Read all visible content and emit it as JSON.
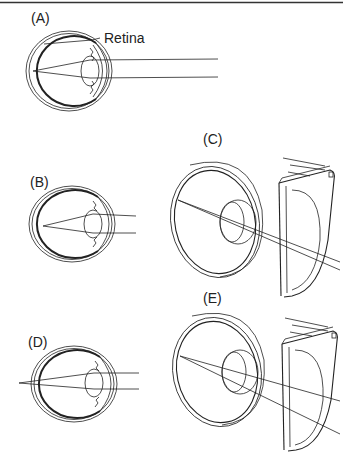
{
  "figure": {
    "top_rule": true,
    "panels": [
      {
        "id": "A",
        "label": "(A)",
        "annotation": "Retina",
        "view": "side",
        "focus": "on-retina"
      },
      {
        "id": "B",
        "label": "(B)",
        "view": "side",
        "focus": "in-front-of-retina"
      },
      {
        "id": "C",
        "label": "(C)",
        "view": "3d-with-lens",
        "focus": "corrected"
      },
      {
        "id": "D",
        "label": "(D)",
        "view": "side",
        "focus": "behind-retina"
      },
      {
        "id": "E",
        "label": "(E)",
        "view": "3d-with-lens",
        "focus": "corrected"
      }
    ]
  },
  "colors": {
    "ink": "#222222",
    "background": "#ffffff"
  }
}
